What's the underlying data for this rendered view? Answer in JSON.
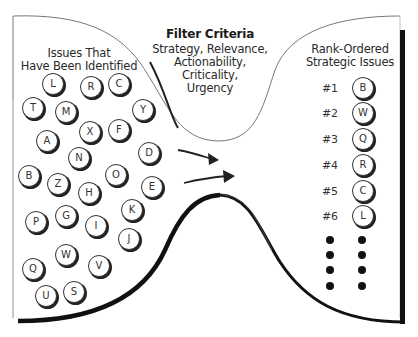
{
  "filter": {
    "title": "Filter Criteria",
    "lines": [
      "Strategy, Relevance,",
      "Actionability,",
      "Criticality,",
      "Urgency"
    ]
  },
  "left": {
    "title_lines": [
      "Issues That",
      "Have Been Identified"
    ],
    "issues": [
      {
        "letter": "L",
        "x": 53,
        "y": 84
      },
      {
        "letter": "R",
        "x": 91,
        "y": 87
      },
      {
        "letter": "C",
        "x": 119,
        "y": 84
      },
      {
        "letter": "T",
        "x": 33,
        "y": 108
      },
      {
        "letter": "M",
        "x": 66,
        "y": 112
      },
      {
        "letter": "Y",
        "x": 143,
        "y": 110
      },
      {
        "letter": "A",
        "x": 47,
        "y": 141
      },
      {
        "letter": "X",
        "x": 90,
        "y": 132
      },
      {
        "letter": "F",
        "x": 119,
        "y": 130
      },
      {
        "letter": "D",
        "x": 149,
        "y": 153
      },
      {
        "letter": "N",
        "x": 79,
        "y": 158
      },
      {
        "letter": "B",
        "x": 29,
        "y": 176
      },
      {
        "letter": "Z",
        "x": 58,
        "y": 184
      },
      {
        "letter": "O",
        "x": 116,
        "y": 175
      },
      {
        "letter": "H",
        "x": 89,
        "y": 193
      },
      {
        "letter": "E",
        "x": 152,
        "y": 187
      },
      {
        "letter": "K",
        "x": 132,
        "y": 210
      },
      {
        "letter": "G",
        "x": 66,
        "y": 216
      },
      {
        "letter": "P",
        "x": 36,
        "y": 222
      },
      {
        "letter": "I",
        "x": 96,
        "y": 226
      },
      {
        "letter": "J",
        "x": 129,
        "y": 239
      },
      {
        "letter": "W",
        "x": 66,
        "y": 255
      },
      {
        "letter": "V",
        "x": 99,
        "y": 266
      },
      {
        "letter": "Q",
        "x": 33,
        "y": 269
      },
      {
        "letter": "S",
        "x": 74,
        "y": 292
      },
      {
        "letter": "U",
        "x": 46,
        "y": 296
      }
    ]
  },
  "right": {
    "title_lines": [
      "Rank-Ordered",
      "Strategic Issues"
    ],
    "ranks": [
      {
        "rank": "#1",
        "letter": "B",
        "y": 88
      },
      {
        "rank": "#2",
        "letter": "W",
        "y": 113
      },
      {
        "rank": "#3",
        "letter": "Q",
        "y": 139
      },
      {
        "rank": "#4",
        "letter": "R",
        "y": 165
      },
      {
        "rank": "#5",
        "letter": "C",
        "y": 191
      },
      {
        "rank": "#6",
        "letter": "L",
        "y": 216
      }
    ],
    "continuation_dots_y": [
      240,
      255,
      270,
      286
    ]
  }
}
